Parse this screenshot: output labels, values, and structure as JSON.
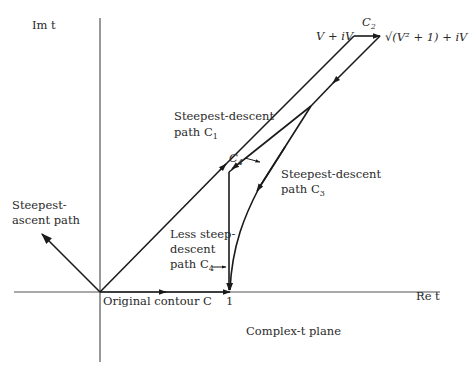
{
  "figure": {
    "plane_label": "Complex-t plane",
    "axes": {
      "imag_label": "Im t",
      "real_label": "Re t"
    },
    "points": {
      "origin_label": "",
      "one_label": "1",
      "corner_left_label": "V + iV",
      "corner_right_label": "√(V² + 1) + iV"
    },
    "paths": {
      "c1": {
        "name": "Steepest-descent path C1",
        "line1": "Steepest-descent",
        "line2": "path C",
        "sub": "1"
      },
      "c2": {
        "name": "C2",
        "label": "C",
        "sub": "2"
      },
      "c3": {
        "name": "Steepest-descent path C3",
        "line1": "Steepest-descent",
        "line2": "path C",
        "sub": "3"
      },
      "c4_pointer": {
        "label": "C",
        "sub": "4"
      },
      "c4": {
        "name": "Less steep-descent path C4",
        "line1": "Less steep-",
        "line2": "descent",
        "line3": "path C",
        "sub": "4"
      },
      "original": {
        "name": "Original contour C",
        "label": "Original contour C"
      },
      "ascent": {
        "name": "Steepest-ascent path",
        "line1": "Steepest-",
        "line2": "ascent path"
      }
    }
  }
}
